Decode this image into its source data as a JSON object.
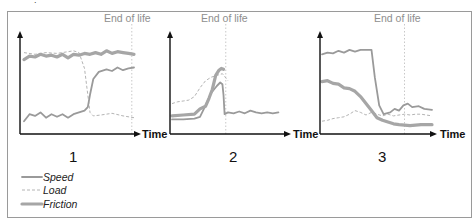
{
  "figure": {
    "end_of_life_label": "End of life",
    "x_axis_label": "Time",
    "legend": [
      {
        "key": "speed",
        "label": "Speed"
      },
      {
        "key": "load",
        "label": "Load"
      },
      {
        "key": "friction",
        "label": "Friction"
      }
    ],
    "colors": {
      "axis": "#111111",
      "speed": "#9a9a9a",
      "load": "#b4b4b4",
      "friction": "#a6a6a6",
      "end_of_life": "#8e8e8e",
      "frame": "#9a9a9a"
    },
    "panels": [
      {
        "id": "1",
        "label": "1",
        "end_of_life_t": 0.98,
        "series": {
          "speed": [
            [
              0.0,
              0.1
            ],
            [
              0.05,
              0.18
            ],
            [
              0.1,
              0.16
            ],
            [
              0.15,
              0.2
            ],
            [
              0.2,
              0.14
            ],
            [
              0.25,
              0.18
            ],
            [
              0.3,
              0.15
            ],
            [
              0.35,
              0.18
            ],
            [
              0.4,
              0.14
            ],
            [
              0.45,
              0.18
            ],
            [
              0.5,
              0.2
            ],
            [
              0.55,
              0.22
            ],
            [
              0.58,
              0.26
            ],
            [
              0.6,
              0.4
            ],
            [
              0.63,
              0.58
            ],
            [
              0.68,
              0.66
            ],
            [
              0.75,
              0.69
            ],
            [
              0.8,
              0.67
            ],
            [
              0.85,
              0.71
            ],
            [
              0.9,
              0.68
            ],
            [
              0.95,
              0.7
            ],
            [
              1.0,
              0.71
            ]
          ],
          "load": [
            [
              0.0,
              0.88
            ],
            [
              0.1,
              0.86
            ],
            [
              0.2,
              0.88
            ],
            [
              0.3,
              0.87
            ],
            [
              0.4,
              0.89
            ],
            [
              0.45,
              0.9
            ],
            [
              0.5,
              0.88
            ],
            [
              0.55,
              0.7
            ],
            [
              0.58,
              0.4
            ],
            [
              0.6,
              0.2
            ],
            [
              0.63,
              0.16
            ],
            [
              0.7,
              0.17
            ],
            [
              0.8,
              0.19
            ],
            [
              0.9,
              0.16
            ],
            [
              1.0,
              0.14
            ]
          ],
          "friction": [
            [
              0.0,
              0.8
            ],
            [
              0.05,
              0.84
            ],
            [
              0.1,
              0.83
            ],
            [
              0.15,
              0.86
            ],
            [
              0.2,
              0.84
            ],
            [
              0.25,
              0.85
            ],
            [
              0.3,
              0.83
            ],
            [
              0.35,
              0.86
            ],
            [
              0.4,
              0.82
            ],
            [
              0.45,
              0.86
            ],
            [
              0.5,
              0.85
            ],
            [
              0.55,
              0.87
            ],
            [
              0.6,
              0.86
            ],
            [
              0.65,
              0.88
            ],
            [
              0.7,
              0.86
            ],
            [
              0.75,
              0.9
            ],
            [
              0.8,
              0.87
            ],
            [
              0.85,
              0.89
            ],
            [
              0.9,
              0.88
            ],
            [
              0.95,
              0.87
            ],
            [
              1.0,
              0.86
            ]
          ]
        }
      },
      {
        "id": "2",
        "label": "2",
        "end_of_life_t": 0.48,
        "series": {
          "speed": [
            [
              0.0,
              0.12
            ],
            [
              0.1,
              0.12
            ],
            [
              0.2,
              0.13
            ],
            [
              0.25,
              0.15
            ],
            [
              0.3,
              0.28
            ],
            [
              0.35,
              0.42
            ],
            [
              0.4,
              0.5
            ],
            [
              0.43,
              0.54
            ],
            [
              0.45,
              0.52
            ],
            [
              0.46,
              0.4
            ],
            [
              0.47,
              0.18
            ],
            [
              0.5,
              0.2
            ],
            [
              0.55,
              0.19
            ],
            [
              0.6,
              0.21
            ],
            [
              0.65,
              0.19
            ],
            [
              0.7,
              0.22
            ],
            [
              0.75,
              0.2
            ],
            [
              0.8,
              0.19
            ],
            [
              0.85,
              0.2
            ],
            [
              0.9,
              0.19
            ],
            [
              0.95,
              0.2
            ]
          ],
          "load": [
            [
              0.0,
              0.3
            ],
            [
              0.05,
              0.32
            ],
            [
              0.1,
              0.33
            ],
            [
              0.15,
              0.34
            ],
            [
              0.2,
              0.38
            ],
            [
              0.25,
              0.48
            ],
            [
              0.3,
              0.56
            ],
            [
              0.35,
              0.6
            ],
            [
              0.4,
              0.62
            ],
            [
              0.45,
              0.64
            ],
            [
              0.5,
              0.56
            ]
          ],
          "friction": [
            [
              0.0,
              0.16
            ],
            [
              0.1,
              0.17
            ],
            [
              0.2,
              0.18
            ],
            [
              0.25,
              0.24
            ],
            [
              0.3,
              0.27
            ],
            [
              0.33,
              0.36
            ],
            [
              0.36,
              0.46
            ],
            [
              0.39,
              0.62
            ],
            [
              0.42,
              0.68
            ],
            [
              0.44,
              0.7
            ],
            [
              0.46,
              0.69
            ]
          ]
        }
      },
      {
        "id": "3",
        "label": "3",
        "end_of_life_t": 0.75,
        "series": {
          "speed": [
            [
              0.0,
              0.86
            ],
            [
              0.05,
              0.88
            ],
            [
              0.1,
              0.87
            ],
            [
              0.15,
              0.9
            ],
            [
              0.2,
              0.88
            ],
            [
              0.25,
              0.91
            ],
            [
              0.3,
              0.89
            ],
            [
              0.35,
              0.91
            ],
            [
              0.4,
              0.91
            ],
            [
              0.45,
              0.91
            ],
            [
              0.48,
              0.6
            ],
            [
              0.52,
              0.28
            ],
            [
              0.56,
              0.18
            ],
            [
              0.62,
              0.2
            ],
            [
              0.66,
              0.24
            ],
            [
              0.7,
              0.22
            ],
            [
              0.74,
              0.28
            ],
            [
              0.78,
              0.3
            ],
            [
              0.82,
              0.26
            ],
            [
              0.88,
              0.27
            ],
            [
              0.93,
              0.24
            ],
            [
              1.0,
              0.23
            ]
          ],
          "load": [
            [
              0.0,
              0.1
            ],
            [
              0.05,
              0.11
            ],
            [
              0.1,
              0.13
            ],
            [
              0.15,
              0.14
            ],
            [
              0.2,
              0.15
            ],
            [
              0.25,
              0.18
            ],
            [
              0.3,
              0.22
            ],
            [
              0.35,
              0.2
            ],
            [
              0.4,
              0.17
            ],
            [
              0.45,
              0.2
            ],
            [
              0.5,
              0.18
            ],
            [
              0.55,
              0.16
            ],
            [
              0.6,
              0.18
            ],
            [
              0.65,
              0.16
            ],
            [
              0.7,
              0.17
            ],
            [
              0.75,
              0.18
            ],
            [
              0.8,
              0.17
            ],
            [
              0.85,
              0.18
            ],
            [
              0.9,
              0.18
            ],
            [
              1.0,
              0.16
            ]
          ],
          "friction": [
            [
              0.0,
              0.55
            ],
            [
              0.05,
              0.56
            ],
            [
              0.1,
              0.53
            ],
            [
              0.15,
              0.52
            ],
            [
              0.2,
              0.48
            ],
            [
              0.25,
              0.47
            ],
            [
              0.3,
              0.44
            ],
            [
              0.35,
              0.38
            ],
            [
              0.4,
              0.3
            ],
            [
              0.45,
              0.22
            ],
            [
              0.5,
              0.14
            ],
            [
              0.55,
              0.11
            ],
            [
              0.6,
              0.09
            ],
            [
              0.65,
              0.07
            ],
            [
              0.7,
              0.06
            ],
            [
              0.8,
              0.05
            ],
            [
              0.9,
              0.06
            ],
            [
              1.0,
              0.06
            ]
          ]
        }
      }
    ]
  }
}
